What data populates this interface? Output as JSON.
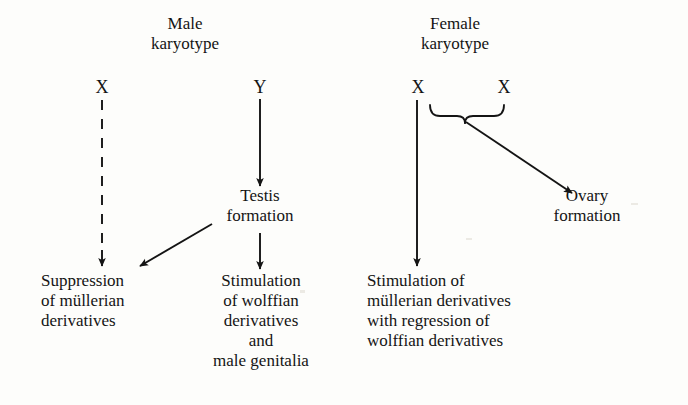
{
  "diagram": {
    "type": "flow-diagram",
    "background_color": "#fdfdfb",
    "ink_color": "#141414",
    "headings": {
      "male": "Male\nkaryotype",
      "female": "Female\nkaryotype"
    },
    "alleles": {
      "male_x": "X",
      "male_y": "Y",
      "female_x_left": "X",
      "female_x_right": "X"
    },
    "nodes": {
      "testis_formation": "Testis\nformation",
      "ovary_formation": "Ovary\nformation",
      "suppression_mullerian": "Suppression\nof müllerian\nderivatives",
      "stimulation_wolffian": "Stimulation\nof wolffian\nderivatives\nand\nmale genitalia",
      "stimulation_mullerian": "Stimulation of\nmüllerian derivatives\nwith regression of\nwolffian derivatives"
    },
    "connectors": [
      {
        "name": "x-to-suppression",
        "style": "dashed",
        "from": "male_x",
        "to": "suppression_mullerian"
      },
      {
        "name": "y-to-testis",
        "style": "solid",
        "from": "male_y",
        "to": "testis_formation"
      },
      {
        "name": "testis-to-suppression",
        "style": "solid-diagonal",
        "from": "testis_formation",
        "to": "suppression_mullerian"
      },
      {
        "name": "testis-to-stimulation-wolffian",
        "style": "solid",
        "from": "testis_formation",
        "to": "stimulation_wolffian"
      },
      {
        "name": "female-x-to-stimulation-mullerian",
        "style": "solid",
        "from": "female_x_left",
        "to": "stimulation_mullerian"
      },
      {
        "name": "brace-to-ovary",
        "style": "solid-diagonal",
        "from": "female_x_brace",
        "to": "ovary_formation"
      }
    ],
    "brace": {
      "name": "xx-pairing-brace",
      "spans": [
        "female_x_left",
        "female_x_right"
      ]
    }
  }
}
